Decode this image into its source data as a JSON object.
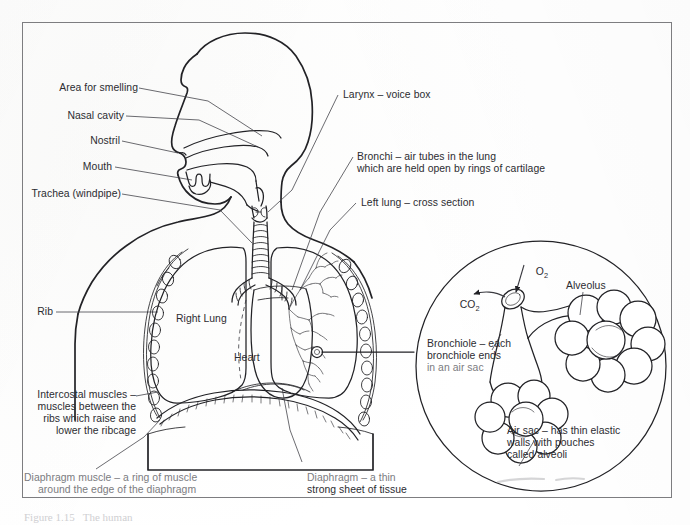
{
  "figure": {
    "caption": "Figure 1.15   The human"
  },
  "colors": {
    "ink": "#2c2c31",
    "line": "#222226",
    "frame": "#7d7d80",
    "paper": "#fdfdfc",
    "faded": "#7b7b80"
  },
  "labels": {
    "area_for_smelling": "Area for smelling",
    "nasal_cavity": "Nasal cavity",
    "nostril": "Nostril",
    "mouth": "Mouth",
    "trachea": "Trachea (windpipe)",
    "rib": "Rib",
    "right_lung": "Right Lung",
    "heart": "Heart",
    "larynx": "Larynx – voice box",
    "bronchi_line1": "Bronchi – air tubes in the lung",
    "bronchi_line2": "which are held open by rings of cartilage",
    "left_lung": "Left lung – cross section",
    "intercostal_line1": "Intercostal muscles –",
    "intercostal_line2": "muscles between the",
    "intercostal_line3": "ribs which raise and",
    "intercostal_line4": "lower the ribcage",
    "diaphragm_muscle_line1": "Diaphragm muscle – a ring of muscle",
    "diaphragm_muscle_line2": "around the edge of the diaphragm",
    "diaphragm_line1": "Diaphragm – a thin",
    "diaphragm_line2": "strong sheet of tissue"
  },
  "detail": {
    "oxygen": "O",
    "oxygen_sub": "2",
    "carbon_dioxide": "CO",
    "carbon_dioxide_sub": "2",
    "alveolus": "Alveolus",
    "bronchiole_line1": "Bronchiole – each",
    "bronchiole_line2": "bronchiole ends",
    "bronchiole_line3": "in an air sac",
    "air_sac_line1": "Air sac – has thin elastic",
    "air_sac_line2": "walls with pouches",
    "air_sac_line3": "called alveoli"
  }
}
